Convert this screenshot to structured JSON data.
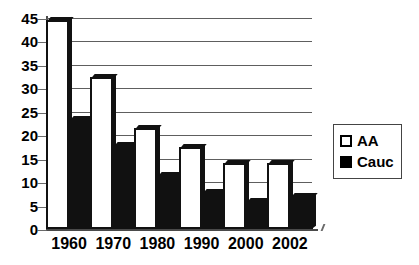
{
  "chart_data": {
    "type": "bar",
    "title": "",
    "subtitle": "",
    "xlabel": "",
    "ylabel": "",
    "categories": [
      "1960",
      "1970",
      "1980",
      "1990",
      "2000",
      "2002"
    ],
    "series": [
      {
        "name": "AA",
        "values": [
          44.5,
          32.5,
          21.5,
          17.5,
          14,
          14
        ],
        "color": "#ffffff"
      },
      {
        "name": "Cauc",
        "values": [
          23.5,
          18,
          11.5,
          8,
          6,
          7
        ],
        "color": "#000000"
      }
    ],
    "ylim": [
      0,
      45
    ],
    "yticks": [
      0,
      5,
      10,
      15,
      20,
      25,
      30,
      35,
      40,
      45
    ],
    "ytick_labels": [
      "0",
      "5",
      "10",
      "15",
      "20",
      "25",
      "30",
      "35",
      "40",
      "45"
    ],
    "grid": true,
    "grid_axis": "y",
    "legend_position": "right",
    "legend": [
      {
        "label": "AA",
        "swatch": "hollow-square-icon"
      },
      {
        "label": "Cauc",
        "swatch": "filled-square-icon"
      }
    ]
  }
}
